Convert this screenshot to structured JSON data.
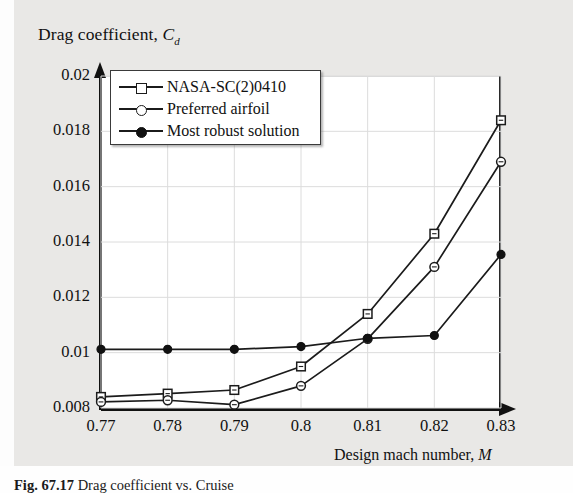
{
  "figure": {
    "background_color": "#e9e8e6",
    "plot_background": "#ffffff",
    "line_color": "#1b1b1b",
    "caption_text": "Fig. 67.17 Drag coefficient for C_d for",
    "caption_label": "Fig. 67.17",
    "caption_rest": "  Drag coefficient vs. Cruise"
  },
  "axis": {
    "y_title_main": "Drag coefficient, ",
    "y_title_symbol": "C",
    "y_title_sub": "d",
    "x_title_main": "Design mach number, ",
    "x_title_symbol": "M",
    "y_ticks": [
      "0.008",
      "0.01",
      "0.012",
      "0.014",
      "0.016",
      "0.018",
      "0.02"
    ],
    "x_ticks": [
      "0.77",
      "0.78",
      "0.79",
      "0.8",
      "0.81",
      "0.82",
      "0.83"
    ]
  },
  "legend": {
    "items": [
      {
        "label": "NASA-SC(2)0410",
        "marker": "open-square",
        "marker_name": "open-square-marker-icon"
      },
      {
        "label": "Preferred airfoil",
        "marker": "open-circle",
        "marker_name": "open-circle-marker-icon"
      },
      {
        "label": "Most robust solution",
        "marker": "filled-circle",
        "marker_name": "filled-circle-marker-icon"
      }
    ]
  },
  "chart_data": {
    "type": "line",
    "title": "",
    "xlabel": "Design mach number, M",
    "ylabel": "Drag coefficient, Cd",
    "x": [
      0.77,
      0.78,
      0.79,
      0.8,
      0.81,
      0.82,
      0.83
    ],
    "xlim": [
      0.77,
      0.83
    ],
    "ylim": [
      0.008,
      0.02
    ],
    "ytick_step": 0.002,
    "xtick_step": 0.01,
    "grid": true,
    "legend_position": "upper-left-inside",
    "series": [
      {
        "name": "NASA-SC(2)0410",
        "marker": "open-square",
        "values": [
          0.0084,
          0.00852,
          0.00865,
          0.0095,
          0.0114,
          0.0143,
          0.0184
        ]
      },
      {
        "name": "Preferred airfoil",
        "marker": "open-circle",
        "values": [
          0.00822,
          0.00828,
          0.00812,
          0.0088,
          0.0105,
          0.0131,
          0.0169
        ]
      },
      {
        "name": "Most robust solution",
        "marker": "filled-circle",
        "values": [
          0.01012,
          0.01012,
          0.01012,
          0.01022,
          0.01052,
          0.01062,
          0.01355
        ]
      }
    ]
  }
}
